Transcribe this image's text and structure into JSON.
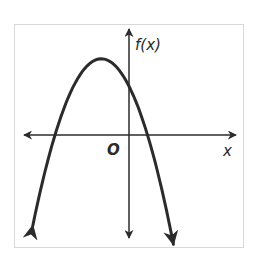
{
  "chart_data": {
    "type": "line",
    "title": "",
    "xlabel": "x",
    "ylabel": "f(x)",
    "origin_label": "O",
    "grid": false,
    "legend": null,
    "series": [
      {
        "name": "f(x)",
        "approx_equation": "f(x) = -x^2 - 3x + 4",
        "x": [
          -5.2,
          -4,
          -3,
          -2,
          -1.5,
          -1,
          0,
          1,
          2,
          2.4
        ],
        "y": [
          -7.44,
          0,
          4,
          6,
          6.25,
          6,
          4,
          0,
          -6,
          -8.96
        ]
      }
    ],
    "key_points": {
      "x_intercepts": [
        -4,
        1
      ],
      "vertex": [
        -1.5,
        6.25
      ],
      "y_intercept": 4
    },
    "colors": {
      "curve": "#2b2b2b",
      "axes": "#2b2b2b",
      "frame": "#d9d9d9"
    }
  }
}
